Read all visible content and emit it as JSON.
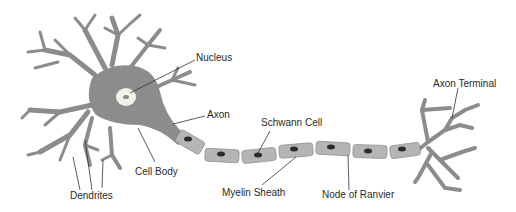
{
  "diagram": {
    "labels": {
      "nucleus": "Nucleus",
      "axon": "Axon",
      "cell_body": "Cell Body",
      "dendrites": "Dendrites",
      "schwann_cell": "Schwann Cell",
      "myelin_sheath": "Myelin Sheath",
      "node_of_ranvier": "Node of Ranvier",
      "axon_terminal": "Axon Terminal"
    },
    "colors": {
      "neuron_fill": "#8c8c8c",
      "sheath_fill": "#b5b5b5",
      "sheath_stroke": "#8a8a8a",
      "nucleus_ring": "#f2f2ea",
      "schwann_nucleus": "#2b2b2b",
      "leader_line": "#333333",
      "text": "#2a2a2a"
    }
  }
}
